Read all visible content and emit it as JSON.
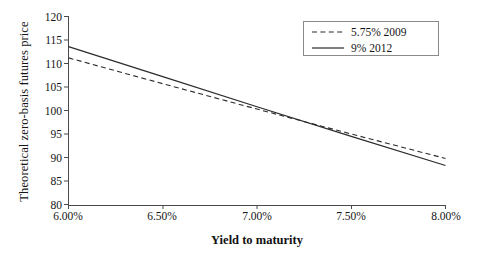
{
  "chart_data": {
    "type": "line",
    "title": "",
    "xlabel": "Yield to maturity",
    "ylabel": "Theoretical zero-basis futures price",
    "xlim": [
      6.0,
      8.0
    ],
    "ylim": [
      80,
      120
    ],
    "xticks": [
      6.0,
      6.5,
      7.0,
      7.5,
      8.0
    ],
    "xtick_labels": [
      "6.00%",
      "6.50%",
      "7.00%",
      "7.50%",
      "8.00%"
    ],
    "yticks": [
      80,
      85,
      90,
      95,
      100,
      105,
      110,
      115,
      120
    ],
    "ytick_labels": [
      "80",
      "85",
      "90",
      "95",
      "100",
      "105",
      "110",
      "115",
      "120"
    ],
    "grid": false,
    "legend_position": "top-right",
    "x": [
      6.0,
      6.5,
      7.0,
      7.5,
      8.0
    ],
    "series": [
      {
        "name": "5.75% 2009",
        "style": "dashed",
        "color": "#2b2b2b",
        "values": [
          111.2,
          105.7,
          100.3,
          95.0,
          89.8
        ]
      },
      {
        "name": "9% 2012",
        "style": "solid",
        "color": "#2b2b2b",
        "values": [
          113.6,
          107.2,
          100.8,
          94.5,
          88.3
        ]
      }
    ]
  },
  "legend": {
    "entries": [
      {
        "label": "5.75% 2009",
        "style": "dashed"
      },
      {
        "label": "9% 2012",
        "style": "solid"
      }
    ]
  },
  "axes": {
    "y_title": "Theoretical zero-basis futures price",
    "x_title": "Yield to maturity",
    "y_labels": [
      "120",
      "115",
      "110",
      "105",
      "100",
      "95",
      "90",
      "85",
      "80"
    ],
    "x_labels": [
      "6.00%",
      "6.50%",
      "7.00%",
      "7.50%",
      "8.00%"
    ]
  },
  "colors": {
    "axis": "#4a4a4a",
    "line": "#2b2b2b",
    "text": "#151515",
    "legend_border": "#8a8a8a",
    "background": "#ffffff"
  }
}
